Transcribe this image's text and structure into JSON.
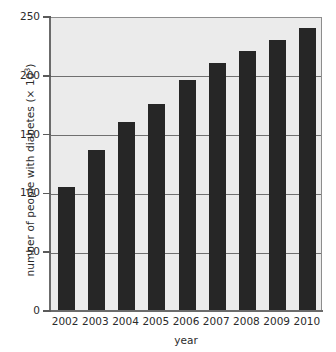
{
  "chart_data": {
    "type": "bar",
    "title": "",
    "xlabel": "year",
    "ylabel_prefix": "number of people with diabetes (× 10",
    "ylabel_exponent": "3",
    "ylabel_suffix": ")",
    "ylabel": "number of people with diabetes (× 10³)",
    "categories": [
      "2002",
      "2003",
      "2004",
      "2005",
      "2006",
      "2007",
      "2008",
      "2009",
      "2010"
    ],
    "values": [
      105,
      136,
      160,
      175,
      196,
      210,
      220,
      230,
      240
    ],
    "ylim": [
      0,
      250
    ],
    "xlim_categories": 9,
    "y_ticks": [
      "0",
      "50",
      "100",
      "150",
      "200",
      "250"
    ],
    "y_tick_values": [
      0,
      50,
      100,
      150,
      200,
      250
    ],
    "grid": true,
    "grid_axis": "y",
    "legend": "none",
    "bar_color": "#262626",
    "plot_background_color": "#ebebeb",
    "gridline_color": "#6f6f6f",
    "axis_color": "#6b6b6b",
    "text_color": "#2b2b2b",
    "page_background_color": "#ffffff"
  }
}
